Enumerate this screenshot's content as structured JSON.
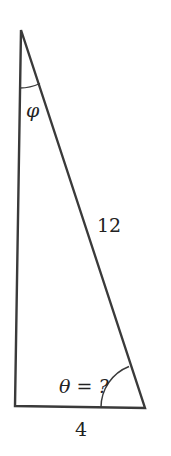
{
  "diagram": {
    "type": "right-triangle",
    "colors": {
      "stroke": "#3a3a3a",
      "text": "#222222",
      "background": "#ffffff"
    },
    "vertices": {
      "top": [
        21,
        30
      ],
      "bottom_left": [
        15,
        406
      ],
      "bottom_right": [
        145,
        408
      ]
    },
    "labels": {
      "hypotenuse": "12",
      "base": "4",
      "top_angle": "φ",
      "bottom_right_angle": "θ = ?"
    }
  }
}
